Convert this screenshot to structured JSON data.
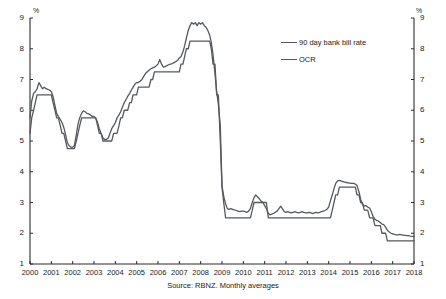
{
  "chart_data": {
    "type": "line",
    "title": "",
    "subtitle": "",
    "xlabel": "",
    "ylabel": "%",
    "y_unit_label": "%",
    "ylim": [
      1,
      9
    ],
    "xlim": [
      2000,
      2018
    ],
    "grid": false,
    "legend_position": "top-right",
    "source_note": "Source: RBNZ. Monthly averages",
    "yticks": [
      1,
      2,
      3,
      4,
      5,
      6,
      7,
      8,
      9
    ],
    "ytick_labels": [
      "1",
      "2",
      "3",
      "4",
      "5",
      "6",
      "7",
      "8",
      "9"
    ],
    "ytick_labels_right": [
      "1",
      "2",
      "3",
      "4",
      "5",
      "6",
      "7",
      "8",
      "9"
    ],
    "xticks": [
      2000,
      2001,
      2002,
      2003,
      2004,
      2005,
      2006,
      2007,
      2008,
      2009,
      2010,
      2011,
      2012,
      2013,
      2014,
      2015,
      2016,
      2017,
      2018
    ],
    "xtick_labels": [
      "2000",
      "2001",
      "2002",
      "2003",
      "2004",
      "2005",
      "2006",
      "2007",
      "2008",
      "2009",
      "2010",
      "2011",
      "2012",
      "2013",
      "2014",
      "2015",
      "2016",
      "2017",
      "2018"
    ],
    "series": [
      {
        "name": "90 day bank bill rate",
        "color": "#55595d",
        "x": [
          2000.0,
          2000.08,
          2000.17,
          2000.25,
          2000.33,
          2000.42,
          2000.5,
          2000.58,
          2000.67,
          2000.75,
          2000.83,
          2000.92,
          2001.0,
          2001.08,
          2001.17,
          2001.25,
          2001.33,
          2001.42,
          2001.5,
          2001.58,
          2001.67,
          2001.75,
          2001.83,
          2001.92,
          2002.0,
          2002.08,
          2002.17,
          2002.25,
          2002.33,
          2002.42,
          2002.5,
          2002.58,
          2002.67,
          2002.75,
          2002.83,
          2002.92,
          2003.0,
          2003.08,
          2003.17,
          2003.25,
          2003.33,
          2003.42,
          2003.5,
          2003.58,
          2003.67,
          2003.75,
          2003.83,
          2003.92,
          2004.0,
          2004.08,
          2004.17,
          2004.25,
          2004.33,
          2004.42,
          2004.5,
          2004.58,
          2004.67,
          2004.75,
          2004.83,
          2004.92,
          2005.0,
          2005.08,
          2005.17,
          2005.25,
          2005.33,
          2005.42,
          2005.5,
          2005.58,
          2005.67,
          2005.75,
          2005.83,
          2005.92,
          2006.0,
          2006.08,
          2006.17,
          2006.25,
          2006.33,
          2006.42,
          2006.5,
          2006.58,
          2006.67,
          2006.75,
          2006.83,
          2006.92,
          2007.0,
          2007.08,
          2007.17,
          2007.25,
          2007.33,
          2007.42,
          2007.5,
          2007.58,
          2007.67,
          2007.75,
          2007.83,
          2007.92,
          2008.0,
          2008.08,
          2008.17,
          2008.25,
          2008.33,
          2008.42,
          2008.5,
          2008.58,
          2008.67,
          2008.75,
          2008.83,
          2008.92,
          2009.0,
          2009.08,
          2009.17,
          2009.25,
          2009.33,
          2009.42,
          2009.5,
          2009.58,
          2009.67,
          2009.75,
          2009.83,
          2009.92,
          2010.0,
          2010.08,
          2010.17,
          2010.25,
          2010.33,
          2010.42,
          2010.5,
          2010.58,
          2010.67,
          2010.75,
          2010.83,
          2010.92,
          2011.0,
          2011.08,
          2011.17,
          2011.25,
          2011.33,
          2011.42,
          2011.5,
          2011.58,
          2011.67,
          2011.75,
          2011.83,
          2011.92,
          2012.0,
          2012.08,
          2012.17,
          2012.25,
          2012.33,
          2012.42,
          2012.5,
          2012.58,
          2012.67,
          2012.75,
          2012.83,
          2012.92,
          2013.0,
          2013.08,
          2013.17,
          2013.25,
          2013.33,
          2013.42,
          2013.5,
          2013.58,
          2013.67,
          2013.75,
          2013.83,
          2013.92,
          2014.0,
          2014.08,
          2014.17,
          2014.25,
          2014.33,
          2014.42,
          2014.5,
          2014.58,
          2014.67,
          2014.75,
          2014.83,
          2014.92,
          2015.0,
          2015.08,
          2015.17,
          2015.25,
          2015.33,
          2015.42,
          2015.5,
          2015.58,
          2015.67,
          2015.75,
          2015.83,
          2015.92,
          2016.0,
          2016.08,
          2016.17,
          2016.25,
          2016.33,
          2016.42,
          2016.5,
          2016.58,
          2016.67,
          2016.75,
          2016.83,
          2016.92,
          2017.0,
          2017.08,
          2017.17,
          2017.25,
          2017.33,
          2017.42,
          2017.5,
          2017.58,
          2017.67,
          2017.75,
          2017.83,
          2017.92,
          2018.0
        ],
        "values": [
          5.75,
          6.3,
          6.55,
          6.6,
          6.7,
          6.9,
          6.8,
          6.7,
          6.75,
          6.7,
          6.68,
          6.65,
          6.6,
          6.45,
          6.15,
          5.9,
          5.8,
          5.7,
          5.6,
          5.45,
          5.2,
          4.95,
          4.85,
          4.8,
          4.8,
          4.85,
          5.2,
          5.55,
          5.75,
          5.9,
          5.98,
          5.95,
          5.9,
          5.88,
          5.85,
          5.8,
          5.8,
          5.75,
          5.6,
          5.4,
          5.25,
          5.1,
          5.05,
          5.05,
          5.1,
          5.25,
          5.4,
          5.5,
          5.6,
          5.75,
          5.85,
          5.95,
          6.1,
          6.25,
          6.35,
          6.45,
          6.55,
          6.65,
          6.75,
          6.85,
          6.9,
          6.9,
          6.95,
          7.0,
          7.1,
          7.2,
          7.25,
          7.3,
          7.35,
          7.38,
          7.4,
          7.45,
          7.5,
          7.65,
          7.5,
          7.4,
          7.42,
          7.45,
          7.48,
          7.5,
          7.52,
          7.55,
          7.58,
          7.62,
          7.7,
          7.75,
          7.9,
          8.1,
          8.35,
          8.6,
          8.75,
          8.85,
          8.8,
          8.85,
          8.75,
          8.85,
          8.8,
          8.85,
          8.75,
          8.7,
          8.6,
          8.45,
          8.2,
          7.8,
          7.2,
          6.6,
          6.2,
          5.5,
          3.55,
          3.2,
          2.95,
          2.8,
          2.78,
          2.8,
          2.78,
          2.76,
          2.74,
          2.72,
          2.7,
          2.72,
          2.72,
          2.7,
          2.68,
          2.72,
          2.8,
          3.0,
          3.15,
          3.25,
          3.18,
          3.12,
          3.05,
          3.0,
          2.9,
          2.8,
          2.65,
          2.6,
          2.62,
          2.65,
          2.68,
          2.72,
          2.8,
          2.88,
          2.8,
          2.7,
          2.68,
          2.7,
          2.68,
          2.66,
          2.68,
          2.7,
          2.68,
          2.66,
          2.68,
          2.7,
          2.68,
          2.66,
          2.66,
          2.68,
          2.66,
          2.64,
          2.66,
          2.68,
          2.66,
          2.68,
          2.7,
          2.72,
          2.74,
          2.78,
          2.85,
          3.05,
          3.25,
          3.45,
          3.62,
          3.7,
          3.72,
          3.7,
          3.68,
          3.66,
          3.65,
          3.64,
          3.63,
          3.62,
          3.62,
          3.6,
          3.55,
          3.35,
          3.1,
          2.95,
          2.88,
          2.9,
          2.85,
          2.82,
          2.7,
          2.55,
          2.45,
          2.42,
          2.4,
          2.35,
          2.3,
          2.28,
          2.2,
          2.1,
          2.05,
          2.0,
          1.98,
          1.96,
          1.95,
          1.95,
          1.96,
          1.95,
          1.94,
          1.93,
          1.92,
          1.92,
          1.91,
          1.9,
          1.9
        ]
      },
      {
        "name": "OCR",
        "color": "#55595d",
        "x": [
          2000.0,
          2000.08,
          2000.17,
          2000.25,
          2000.33,
          2000.42,
          2000.5,
          2000.58,
          2000.67,
          2000.75,
          2000.83,
          2000.92,
          2001.0,
          2001.08,
          2001.17,
          2001.25,
          2001.33,
          2001.42,
          2001.5,
          2001.58,
          2001.67,
          2001.75,
          2001.83,
          2001.92,
          2002.0,
          2002.08,
          2002.17,
          2002.25,
          2002.33,
          2002.42,
          2002.5,
          2002.58,
          2002.67,
          2002.75,
          2002.83,
          2002.92,
          2003.0,
          2003.08,
          2003.17,
          2003.25,
          2003.33,
          2003.42,
          2003.5,
          2003.58,
          2003.67,
          2003.75,
          2003.83,
          2003.92,
          2004.0,
          2004.08,
          2004.17,
          2004.25,
          2004.33,
          2004.42,
          2004.5,
          2004.58,
          2004.67,
          2004.75,
          2004.83,
          2004.92,
          2005.0,
          2005.08,
          2005.17,
          2005.25,
          2005.33,
          2005.42,
          2005.5,
          2005.58,
          2005.67,
          2005.75,
          2005.83,
          2005.92,
          2006.0,
          2006.08,
          2006.17,
          2006.25,
          2006.33,
          2006.42,
          2006.5,
          2006.58,
          2006.67,
          2006.75,
          2006.83,
          2006.92,
          2007.0,
          2007.08,
          2007.17,
          2007.25,
          2007.33,
          2007.42,
          2007.5,
          2007.58,
          2007.67,
          2007.75,
          2007.83,
          2007.92,
          2008.0,
          2008.08,
          2008.17,
          2008.25,
          2008.33,
          2008.42,
          2008.5,
          2008.58,
          2008.67,
          2008.75,
          2008.83,
          2008.92,
          2009.0,
          2009.08,
          2009.17,
          2009.25,
          2009.33,
          2009.42,
          2009.5,
          2009.58,
          2009.67,
          2009.75,
          2009.83,
          2009.92,
          2010.0,
          2010.08,
          2010.17,
          2010.25,
          2010.33,
          2010.42,
          2010.5,
          2010.58,
          2010.67,
          2010.75,
          2010.83,
          2010.92,
          2011.0,
          2011.08,
          2011.17,
          2011.25,
          2011.33,
          2011.42,
          2011.5,
          2011.58,
          2011.67,
          2011.75,
          2011.83,
          2011.92,
          2012.0,
          2012.08,
          2012.17,
          2012.25,
          2012.33,
          2012.42,
          2012.5,
          2012.58,
          2012.67,
          2012.75,
          2012.83,
          2012.92,
          2013.0,
          2013.08,
          2013.17,
          2013.25,
          2013.33,
          2013.42,
          2013.5,
          2013.58,
          2013.67,
          2013.75,
          2013.83,
          2013.92,
          2014.0,
          2014.08,
          2014.17,
          2014.25,
          2014.33,
          2014.42,
          2014.5,
          2014.58,
          2014.67,
          2014.75,
          2014.83,
          2014.92,
          2015.0,
          2015.08,
          2015.17,
          2015.25,
          2015.33,
          2015.42,
          2015.5,
          2015.58,
          2015.67,
          2015.75,
          2015.83,
          2015.92,
          2016.0,
          2016.08,
          2016.17,
          2016.25,
          2016.33,
          2016.42,
          2016.5,
          2016.58,
          2016.67,
          2016.75,
          2016.83,
          2016.92,
          2017.0,
          2017.08,
          2017.17,
          2017.25,
          2017.33,
          2017.42,
          2017.5,
          2017.58,
          2017.67,
          2017.75,
          2017.83,
          2017.92,
          2018.0
        ],
        "values": [
          5.25,
          5.75,
          6.0,
          6.25,
          6.5,
          6.5,
          6.5,
          6.5,
          6.5,
          6.5,
          6.5,
          6.5,
          6.5,
          6.25,
          6.0,
          5.75,
          5.75,
          5.5,
          5.25,
          5.25,
          5.0,
          4.75,
          4.75,
          4.75,
          4.75,
          4.75,
          5.0,
          5.25,
          5.5,
          5.75,
          5.75,
          5.75,
          5.75,
          5.75,
          5.75,
          5.75,
          5.75,
          5.75,
          5.5,
          5.25,
          5.25,
          5.0,
          5.0,
          5.0,
          5.0,
          5.0,
          5.0,
          5.25,
          5.25,
          5.25,
          5.5,
          5.75,
          5.75,
          6.0,
          6.0,
          6.0,
          6.25,
          6.25,
          6.5,
          6.5,
          6.5,
          6.75,
          6.75,
          6.75,
          6.75,
          6.75,
          6.75,
          6.75,
          7.0,
          7.0,
          7.25,
          7.25,
          7.25,
          7.25,
          7.25,
          7.25,
          7.25,
          7.25,
          7.25,
          7.25,
          7.25,
          7.25,
          7.25,
          7.25,
          7.25,
          7.5,
          7.5,
          7.75,
          8.0,
          8.0,
          8.25,
          8.25,
          8.25,
          8.25,
          8.25,
          8.25,
          8.25,
          8.25,
          8.25,
          8.25,
          8.25,
          8.25,
          8.0,
          7.5,
          7.5,
          6.5,
          6.5,
          5.0,
          3.5,
          3.0,
          2.5,
          2.5,
          2.5,
          2.5,
          2.5,
          2.5,
          2.5,
          2.5,
          2.5,
          2.5,
          2.5,
          2.5,
          2.5,
          2.5,
          2.5,
          2.75,
          3.0,
          3.0,
          3.0,
          3.0,
          3.0,
          3.0,
          3.0,
          3.0,
          2.5,
          2.5,
          2.5,
          2.5,
          2.5,
          2.5,
          2.5,
          2.5,
          2.5,
          2.5,
          2.5,
          2.5,
          2.5,
          2.5,
          2.5,
          2.5,
          2.5,
          2.5,
          2.5,
          2.5,
          2.5,
          2.5,
          2.5,
          2.5,
          2.5,
          2.5,
          2.5,
          2.5,
          2.5,
          2.5,
          2.5,
          2.5,
          2.5,
          2.5,
          2.5,
          2.5,
          2.75,
          3.0,
          3.25,
          3.25,
          3.5,
          3.5,
          3.5,
          3.5,
          3.5,
          3.5,
          3.5,
          3.5,
          3.5,
          3.5,
          3.25,
          3.25,
          3.0,
          3.0,
          2.75,
          2.75,
          2.75,
          2.5,
          2.5,
          2.5,
          2.25,
          2.25,
          2.25,
          2.25,
          2.0,
          2.0,
          2.0,
          1.75,
          1.75,
          1.75,
          1.75,
          1.75,
          1.75,
          1.75,
          1.75,
          1.75,
          1.75,
          1.75,
          1.75,
          1.75,
          1.75,
          1.75,
          1.75
        ]
      }
    ],
    "legend": [
      {
        "label": "90 day bank bill rate"
      },
      {
        "label": "OCR"
      }
    ]
  },
  "axes": {
    "unit_left": "%",
    "unit_right": "%"
  }
}
